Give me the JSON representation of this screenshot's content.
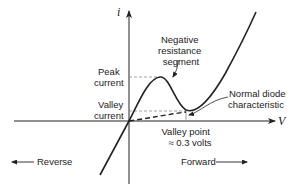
{
  "diagram": {
    "axes": {
      "y_label": "i",
      "x_label": "V"
    },
    "labels": {
      "peak_current_line1": "Peak",
      "peak_current_line2": "current",
      "valley_current_line1": "Valley",
      "valley_current_line2": "current",
      "neg_res_line1": "Negative",
      "neg_res_line2": "resistance",
      "neg_res_line3": "segment",
      "normal_diode_line1": "Normal diode",
      "normal_diode_line2": "characteristic",
      "valley_point_line1": "Valley point",
      "valley_point_line2": "≈ 0.3 volts",
      "reverse": "Reverse",
      "forward": "Forward"
    },
    "colors": {
      "line": "#222222",
      "dashed_guide": "#888888",
      "background": "#ffffff"
    }
  }
}
